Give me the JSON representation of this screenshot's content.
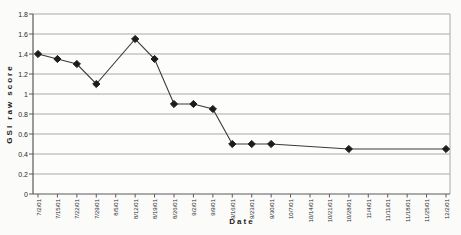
{
  "chart_data": {
    "type": "line",
    "title": "",
    "xlabel": "Date",
    "ylabel": "GSI raw score",
    "x": [
      "7/2/01",
      "7/15/01",
      "7/22/01",
      "7/29/01",
      "8/5/01",
      "8/12/01",
      "8/19/01",
      "8/26/01",
      "9/2/01",
      "9/9/01",
      "9/16/01",
      "9/23/01",
      "9/30/01",
      "10/7/01",
      "10/14/01",
      "10/21/01",
      "10/28/01",
      "11/4/01",
      "11/11/01",
      "11/18/01",
      "11/25/01",
      "12/2/01"
    ],
    "series": [
      {
        "name": "GSI raw score",
        "values": [
          1.4,
          1.35,
          1.3,
          1.1,
          null,
          1.55,
          1.35,
          0.9,
          0.9,
          0.85,
          0.5,
          0.5,
          0.5,
          null,
          null,
          null,
          0.45,
          null,
          null,
          null,
          null,
          0.45
        ]
      }
    ],
    "connect_gaps": true,
    "marker": "diamond",
    "ylim": [
      0,
      1.8
    ],
    "ytick_step": 0.2,
    "yticks": [
      "1.8",
      "1.6",
      "1.4",
      "1.2",
      "1",
      "0.8",
      "0.6",
      "0.4",
      "0.2",
      "0"
    ],
    "x_tick_rotation": 90,
    "grid": "horizontal",
    "legend": "none",
    "colors": {
      "line": "#3a3a3a",
      "marker": "#1c1c1c",
      "gridline": "#a9a9a9",
      "axis": "#5a5a5a",
      "plot_border": "#a9a9a9",
      "background": "#fbfbfa",
      "plot_background": "#fdfdfc"
    }
  }
}
